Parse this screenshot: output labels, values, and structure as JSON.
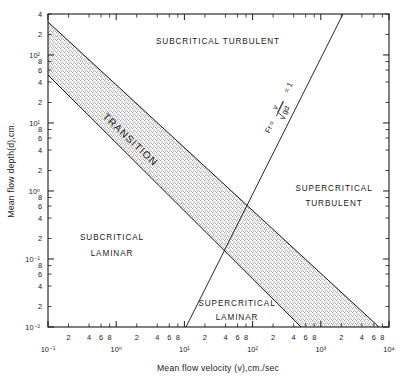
{
  "chart_data": {
    "type": "line",
    "title": "",
    "xlabel": "Mean flow velocity (v),cm./sec",
    "ylabel": "Mean flow depth(d),cm.",
    "xscale": "log",
    "yscale": "log",
    "xlim": [
      0.1,
      10000
    ],
    "ylim": [
      0.01,
      400
    ],
    "grid": false,
    "legend": "none",
    "x_decade_labels": [
      "10⁻¹",
      "10⁰",
      "10¹",
      "10²",
      "10³",
      "10⁴"
    ],
    "x_decade_values": [
      0.1,
      1,
      10,
      100,
      1000,
      10000
    ],
    "x_minor_labels": [
      "2",
      "4",
      "6",
      "8"
    ],
    "x_minor_values": [
      2,
      4,
      6,
      8
    ],
    "y_decade_labels": [
      "10⁻²",
      "10⁻¹",
      "10⁰",
      "10¹",
      "10²"
    ],
    "y_decade_values": [
      0.01,
      0.1,
      1,
      10,
      100
    ],
    "y_minor_labels": [
      "2",
      "4",
      "6",
      "8"
    ],
    "y_minor_values": [
      2,
      4,
      6,
      8
    ],
    "y_top_labels": [
      "2",
      "4"
    ],
    "y_top_values": [
      200,
      400
    ],
    "series": [
      {
        "name": "Transition band upper boundary (laminar-turbulent)",
        "type": "line",
        "x": [
          0.125,
          2200
        ],
        "y": [
          400,
          0.01
        ],
        "note": "upper-left edge of stippled TRANSITION band"
      },
      {
        "name": "Transition band lower boundary (laminar-turbulent)",
        "type": "line",
        "x": [
          0.125,
          600
        ],
        "y": [
          85,
          0.01
        ],
        "note": "lower-right edge of stippled TRANSITION band"
      },
      {
        "name": "Froude number Fr = 1 (critical flow)",
        "type": "line",
        "x": [
          8.5,
          450
        ],
        "y": [
          0.01,
          400
        ],
        "note": "slope 2 on log-log: d = v^2/g"
      }
    ],
    "shaded_regions": [
      {
        "name": "TRANSITION",
        "style": "stipple",
        "color": "#b9b9b9"
      }
    ],
    "annotations": [
      {
        "text": "SUBCRITICAL  TURBULENT",
        "x": 25,
        "y": 190,
        "rotation": 0
      },
      {
        "text": "TRANSITION",
        "x": 4.2,
        "y": 3.6,
        "rotation": 43
      },
      {
        "text": "SUPERCRITICAL",
        "x": 900,
        "y": 0.95,
        "rotation": 0
      },
      {
        "text": "TURBULENT",
        "x": 900,
        "y": 0.62,
        "rotation": 0
      },
      {
        "text": "SUBCRITICAL",
        "x": 0.85,
        "y": 0.2,
        "rotation": 0
      },
      {
        "text": "LAMINAR",
        "x": 0.85,
        "y": 0.135,
        "rotation": 0
      },
      {
        "text": "SUPERCRITICAL",
        "x": 55,
        "y": 0.023,
        "rotation": 0
      },
      {
        "text": "LAMINAR",
        "x": 55,
        "y": 0.016,
        "rotation": 0
      },
      {
        "text": "Fr = v / √gd = 1",
        "x": 110,
        "y": 14,
        "rotation": -63
      }
    ]
  },
  "labels": {
    "region_subcritical_turbulent": "SUBCRITICAL  TURBULENT",
    "region_transition": "TRANSITION",
    "region_supercritical_turbulent_line1": "SUPERCRITICAL",
    "region_supercritical_turbulent_line2": "TURBULENT",
    "region_subcritical_laminar_line1": "SUBCRITICAL",
    "region_subcritical_laminar_line2": "LAMINAR",
    "region_supercritical_laminar_line1": "SUPERCRITICAL",
    "region_supercritical_laminar_line2": "LAMINAR"
  },
  "formula": {
    "prefix": "Fr",
    "equals": "=",
    "numerator": "v",
    "denominator": "gd",
    "radical": "√",
    "result": "= 1"
  },
  "axes": {
    "x_title": "Mean flow velocity (v),cm./sec",
    "y_title": "Mean flow depth(d),cm.",
    "x_ticks": [
      {
        "label": "10⁻¹",
        "value": 0.1,
        "major": true
      },
      {
        "label": "2",
        "value": 0.2,
        "major": false
      },
      {
        "label": "4",
        "value": 0.4,
        "major": false
      },
      {
        "label": "6",
        "value": 0.6,
        "major": false
      },
      {
        "label": "8",
        "value": 0.8,
        "major": false
      },
      {
        "label": "10⁰",
        "value": 1,
        "major": true
      },
      {
        "label": "2",
        "value": 2,
        "major": false
      },
      {
        "label": "4",
        "value": 4,
        "major": false
      },
      {
        "label": "6",
        "value": 6,
        "major": false
      },
      {
        "label": "8",
        "value": 8,
        "major": false
      },
      {
        "label": "10¹",
        "value": 10,
        "major": true
      },
      {
        "label": "2",
        "value": 20,
        "major": false
      },
      {
        "label": "4",
        "value": 40,
        "major": false
      },
      {
        "label": "6",
        "value": 60,
        "major": false
      },
      {
        "label": "8",
        "value": 80,
        "major": false
      },
      {
        "label": "10²",
        "value": 100,
        "major": true
      },
      {
        "label": "2",
        "value": 200,
        "major": false
      },
      {
        "label": "4",
        "value": 400,
        "major": false
      },
      {
        "label": "6",
        "value": 600,
        "major": false
      },
      {
        "label": "8",
        "value": 800,
        "major": false
      },
      {
        "label": "10³",
        "value": 1000,
        "major": true
      },
      {
        "label": "2",
        "value": 2000,
        "major": false
      },
      {
        "label": "4",
        "value": 4000,
        "major": false
      },
      {
        "label": "6",
        "value": 6000,
        "major": false
      },
      {
        "label": "8",
        "value": 8000,
        "major": false
      },
      {
        "label": "10⁴",
        "value": 10000,
        "major": true
      }
    ],
    "y_ticks": [
      {
        "label": "10⁻²",
        "value": 0.01,
        "major": true
      },
      {
        "label": "2",
        "value": 0.02,
        "major": false
      },
      {
        "label": "4",
        "value": 0.04,
        "major": false
      },
      {
        "label": "6",
        "value": 0.06,
        "major": false
      },
      {
        "label": "8",
        "value": 0.08,
        "major": false
      },
      {
        "label": "10⁻¹",
        "value": 0.1,
        "major": true
      },
      {
        "label": "2",
        "value": 0.2,
        "major": false
      },
      {
        "label": "4",
        "value": 0.4,
        "major": false
      },
      {
        "label": "6",
        "value": 0.6,
        "major": false
      },
      {
        "label": "8",
        "value": 0.8,
        "major": false
      },
      {
        "label": "10⁰",
        "value": 1,
        "major": true
      },
      {
        "label": "2",
        "value": 2,
        "major": false
      },
      {
        "label": "4",
        "value": 4,
        "major": false
      },
      {
        "label": "6",
        "value": 6,
        "major": false
      },
      {
        "label": "8",
        "value": 8,
        "major": false
      },
      {
        "label": "10¹",
        "value": 10,
        "major": true
      },
      {
        "label": "2",
        "value": 20,
        "major": false
      },
      {
        "label": "4",
        "value": 40,
        "major": false
      },
      {
        "label": "6",
        "value": 60,
        "major": false
      },
      {
        "label": "8",
        "value": 80,
        "major": false
      },
      {
        "label": "10²",
        "value": 100,
        "major": true
      },
      {
        "label": "2",
        "value": 200,
        "major": false
      },
      {
        "label": "4",
        "value": 400,
        "major": false
      }
    ]
  },
  "colors": {
    "ink": "#1a1a1a",
    "band": "#b9b9b9",
    "background": "#ffffff"
  }
}
